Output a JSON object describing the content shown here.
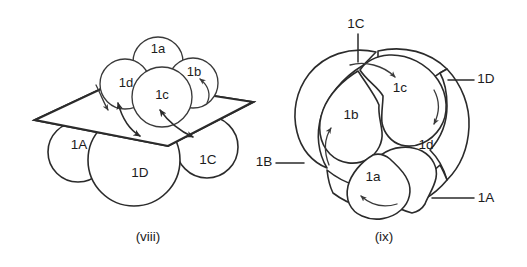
{
  "figure": {
    "background_color": "#ffffff",
    "ink_color": "#2b2b2b",
    "hatch_color": "#6f6f6f",
    "title": "",
    "panels": [
      {
        "id": "viii",
        "caption": "(viii)",
        "description": "Eight-cell embryo in side view with the equatorial cleavage plane shown as a hatched parallelogram; curved double-headed arrows indicate spiral displacement of micromeres relative to macromeres.",
        "macromeres": [
          {
            "label": "1A",
            "position": "lower-left"
          },
          {
            "label": "1D",
            "position": "lower-center"
          },
          {
            "label": "1C",
            "position": "lower-right"
          }
        ],
        "micromeres": [
          {
            "label": "1a",
            "position": "upper-center"
          },
          {
            "label": "1b",
            "position": "upper-right"
          },
          {
            "label": "1c",
            "position": "center"
          },
          {
            "label": "1d",
            "position": "upper-left"
          }
        ],
        "plane": {
          "name": "equatorial-cleavage-plane",
          "style": "hatched-parallelogram"
        },
        "arrows": [
          {
            "name": "spiral-arrow-1d",
            "type": "double-headed-curve"
          },
          {
            "name": "spiral-arrow-1c",
            "type": "double-headed-curve"
          },
          {
            "name": "spiral-arrow-1b",
            "type": "curved-arrow"
          },
          {
            "name": "spiral-arrow-left",
            "type": "curved-arrow"
          }
        ]
      },
      {
        "id": "ix",
        "caption": "(ix)",
        "description": "Eight-cell embryo in animal-pole view: four micromeres 1a-1d form a central rosette surrounded by a ring of four macromeres 1A-1D; curved arrows show the direction of spiral rotation.",
        "micromeres": [
          {
            "label": "1c",
            "position": "top-right"
          },
          {
            "label": "1b",
            "position": "left"
          },
          {
            "label": "1d",
            "position": "right"
          },
          {
            "label": "1a",
            "position": "bottom"
          }
        ],
        "macromere_callouts": [
          {
            "label": "1C",
            "leader": "top",
            "text_x": 356,
            "text_y": 24
          },
          {
            "label": "1D",
            "leader": "right-upper",
            "text_x": 486,
            "text_y": 79
          },
          {
            "label": "1B",
            "leader": "left-lower",
            "text_x": 264,
            "text_y": 162
          },
          {
            "label": "1A",
            "leader": "right-lower",
            "text_x": 486,
            "text_y": 198
          }
        ],
        "arrows": [
          {
            "name": "rotation-arrow-1c",
            "type": "curved-arrow"
          },
          {
            "name": "rotation-arrow-1d",
            "type": "curved-arrow"
          },
          {
            "name": "rotation-arrow-1b",
            "type": "curved-arrow"
          },
          {
            "name": "rotation-arrow-1a",
            "type": "curved-arrow"
          }
        ]
      }
    ]
  }
}
